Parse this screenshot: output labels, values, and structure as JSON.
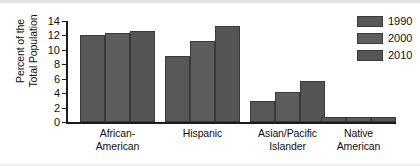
{
  "chart_data": {
    "type": "bar",
    "title": "",
    "xlabel": "",
    "ylabel": "Percent of the\nTotal Population",
    "ylim": [
      0,
      14
    ],
    "ytick_step": 2,
    "yticks": [
      0,
      2,
      4,
      6,
      8,
      10,
      12,
      14
    ],
    "ytick_labels": [
      "0",
      "2",
      "4",
      "6",
      "8",
      "10",
      "12",
      "14"
    ],
    "grid": false,
    "legend_position": "top-right",
    "categories": [
      "African-\nAmerican",
      "Hispanic",
      "Asian/Pacific\nIslander",
      "Native\nAmerican"
    ],
    "series": [
      {
        "name": "1990",
        "color": "#585858",
        "values": [
          12.0,
          9.2,
          2.9,
          0.7
        ]
      },
      {
        "name": "2000",
        "color": "#5d5d5d",
        "values": [
          12.3,
          11.2,
          4.2,
          0.7
        ]
      },
      {
        "name": "2010",
        "color": "#555555",
        "values": [
          12.6,
          13.3,
          5.7,
          0.7
        ]
      }
    ]
  },
  "legend": {
    "entries": [
      {
        "label": "1990"
      },
      {
        "label": "2000"
      },
      {
        "label": "2010"
      }
    ]
  },
  "colors": {
    "bar_fill": "#5a5a5a",
    "bar_edge": "#3a3a3a",
    "axis": "#1c1c1c",
    "background": "#ffffff",
    "text": "#111111"
  }
}
